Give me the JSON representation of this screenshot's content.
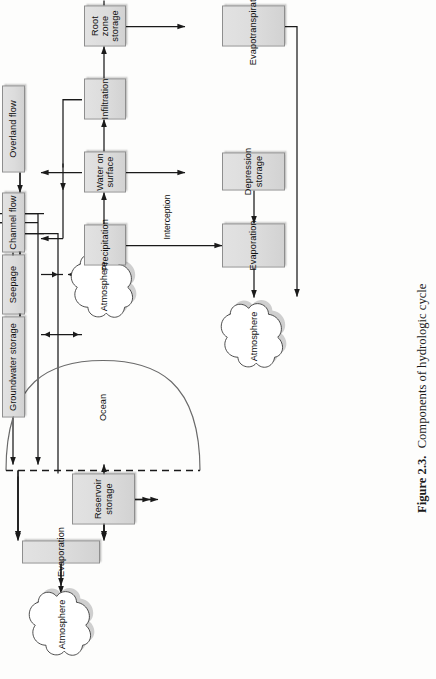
{
  "figure": {
    "caption_label": "Figure 2.3.",
    "caption_text": "Components of hydrologic cycle",
    "caption_full": "Figure 2.3. Components of hydrologic cycle",
    "orientation": "rotated-90-ccw",
    "colors": {
      "page_background": "#fdfdfc",
      "node_fill": "#dcdcdc",
      "node_border": "#8e8e8e",
      "line": "#1a1a1a",
      "text": "#111111"
    }
  },
  "diagram": {
    "title": "Components of hydrologic cycle",
    "type": "flowchart",
    "clouds": [
      {
        "id": "atm-top",
        "label": "Atmosphere"
      },
      {
        "id": "atm-mid",
        "label": "Atmosphere"
      },
      {
        "id": "atm-bottom",
        "label": "Atmosphere"
      }
    ],
    "ocean": {
      "id": "ocean",
      "label": "Ocean"
    },
    "nodes": [
      {
        "id": "evaporation-top",
        "label": "Evaporation"
      },
      {
        "id": "reservoir-storage",
        "label": "Reservoir storage"
      },
      {
        "id": "overland-flow",
        "label": "Overland flow"
      },
      {
        "id": "channel-flow",
        "label": "Channel flow"
      },
      {
        "id": "seepage",
        "label": "Seepage"
      },
      {
        "id": "groundwater-storage-1",
        "label": "Groundwater storage"
      },
      {
        "id": "precipitation",
        "label": "Precipitation"
      },
      {
        "id": "water-on-surface",
        "label": "Water on surface"
      },
      {
        "id": "infiltration",
        "label": "Infiltration"
      },
      {
        "id": "root-zone-storage",
        "label": "Root zone storage"
      },
      {
        "id": "groundwater-storage-2",
        "label": "Groundwater storage"
      },
      {
        "id": "evaporation-bottom",
        "label": "Evaporation"
      },
      {
        "id": "depression-storage",
        "label": "Depression storage"
      },
      {
        "id": "evapotranspiration",
        "label": "Evapotranspiration"
      }
    ],
    "edge_labels": [
      {
        "id": "interception",
        "label": "Interception"
      }
    ],
    "edges": [
      {
        "from": "atm-mid",
        "to": "precipitation"
      },
      {
        "from": "precipitation",
        "to": "water-on-surface"
      },
      {
        "from": "precipitation",
        "to": "evaporation-bottom",
        "label": "Interception"
      },
      {
        "from": "water-on-surface",
        "to": "infiltration"
      },
      {
        "from": "water-on-surface",
        "to": "depression-storage"
      },
      {
        "from": "water-on-surface",
        "to": "overland-flow"
      },
      {
        "from": "depression-storage",
        "to": "evaporation-bottom"
      },
      {
        "from": "evaporation-bottom",
        "to": "atm-bottom"
      },
      {
        "from": "infiltration",
        "to": "root-zone-storage"
      },
      {
        "from": "infiltration",
        "to": "channel-flow"
      },
      {
        "from": "root-zone-storage",
        "to": "groundwater-storage-2"
      },
      {
        "from": "root-zone-storage",
        "to": "evapotranspiration"
      },
      {
        "from": "evapotranspiration",
        "to": "atm-bottom"
      },
      {
        "from": "groundwater-storage-2",
        "to": "groundwater-storage-1",
        "bidirectional": true
      },
      {
        "from": "overland-flow",
        "to": "channel-flow"
      },
      {
        "from": "channel-flow",
        "to": "seepage"
      },
      {
        "from": "channel-flow",
        "to": "reservoir-storage"
      },
      {
        "from": "seepage",
        "to": "groundwater-storage-1"
      },
      {
        "from": "seepage",
        "to": "root-zone-storage",
        "bidirectional": true
      },
      {
        "from": "reservoir-storage",
        "to": "seepage"
      },
      {
        "from": "reservoir-storage",
        "to": "evaporation-top"
      },
      {
        "from": "reservoir-storage",
        "to": "ocean"
      },
      {
        "from": "channel-flow",
        "to": "ocean"
      },
      {
        "from": "groundwater-storage-1",
        "to": "ocean"
      },
      {
        "from": "ocean",
        "to": "evaporation-top"
      },
      {
        "from": "evaporation-top",
        "to": "atm-top"
      }
    ]
  }
}
